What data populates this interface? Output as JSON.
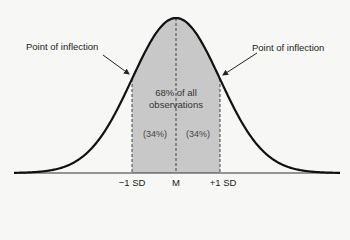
{
  "diagram": {
    "annotations": {
      "left_inflection": "Point of inflection",
      "right_inflection": "Point of inflection",
      "center_line1": "68% of all",
      "center_line2": "observations",
      "left_pct": "(34%)",
      "right_pct": "(34%)"
    },
    "axis_labels": {
      "minus_sd": "−1 SD",
      "mean": "M",
      "plus_sd": "+1 SD"
    },
    "colors": {
      "background": "#f7f7f5",
      "curve": "#111111",
      "shaded": "#c8c8c8",
      "dashed": "#444444"
    }
  }
}
